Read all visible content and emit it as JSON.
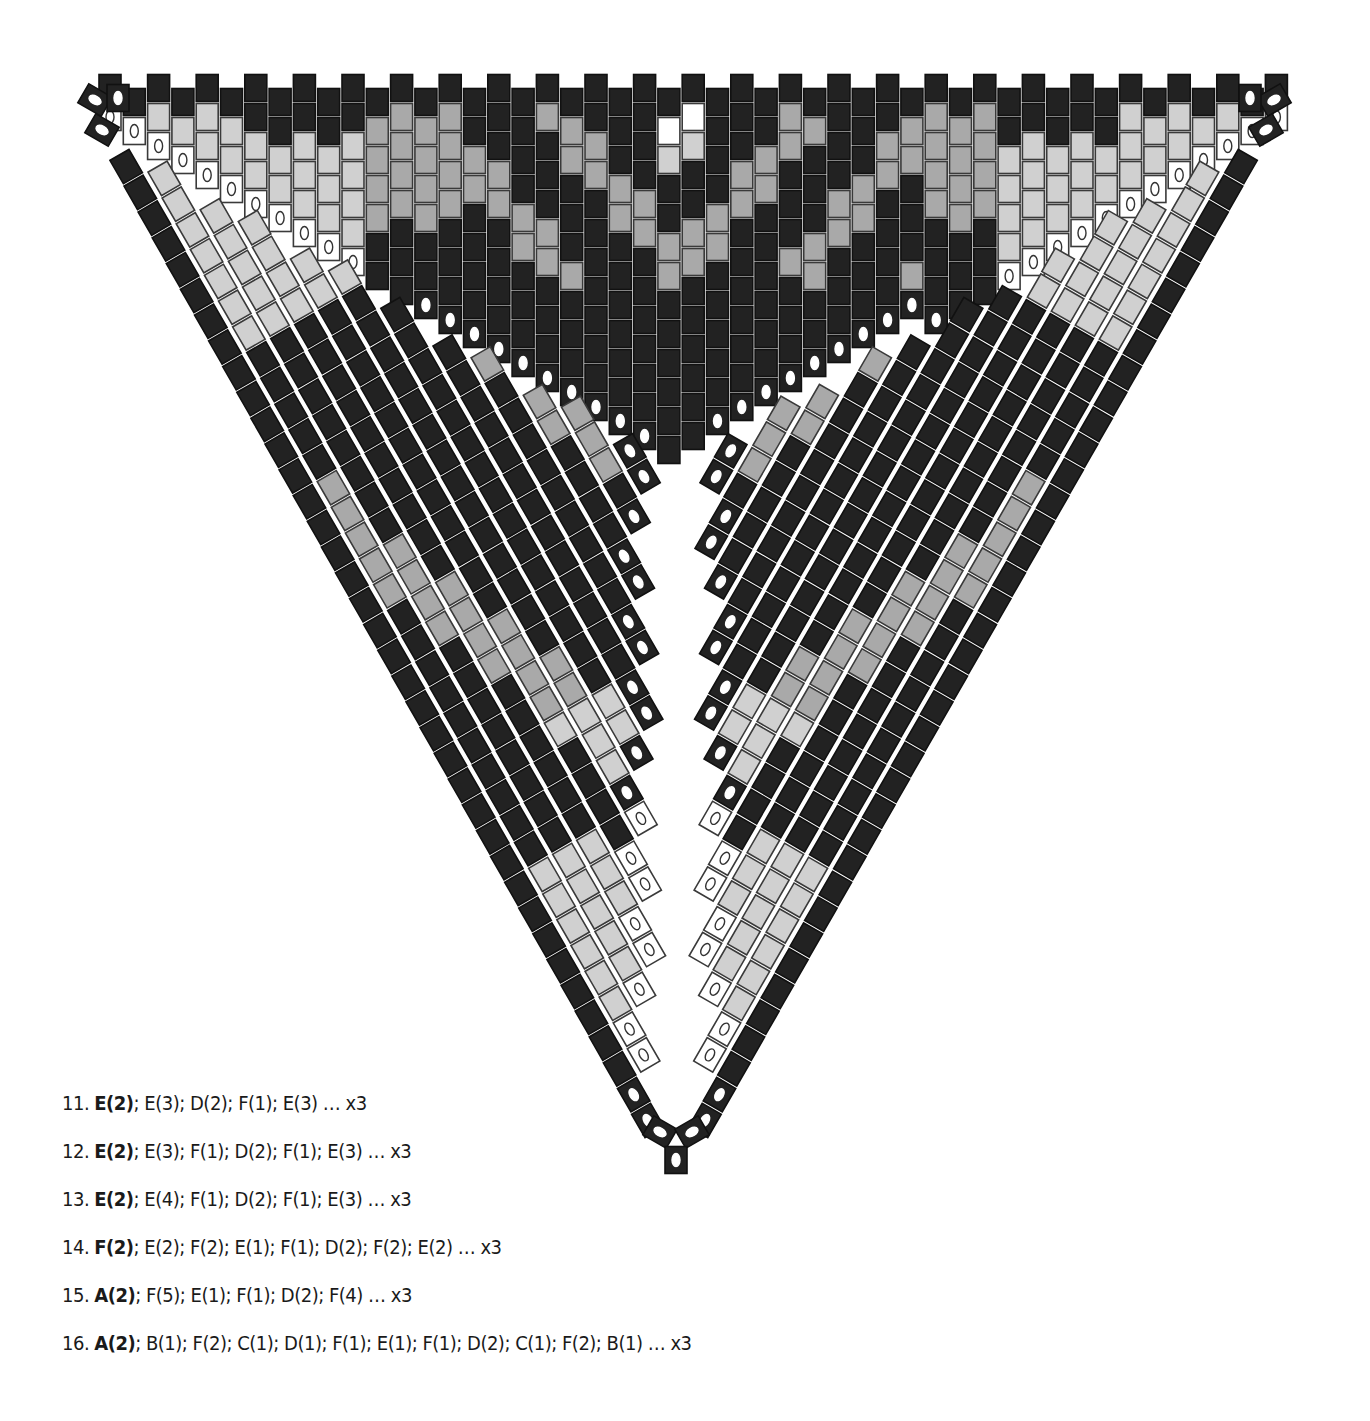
{
  "diagram": {
    "type": "peyote-triangle-bead-chart",
    "top_left": [
      78,
      75
    ],
    "top_right": [
      1290,
      75
    ],
    "apex": [
      676,
      1172
    ],
    "bead_size": [
      22,
      27
    ],
    "column_pitch": 24.3,
    "row_pitch": 29,
    "colors": {
      "A": "#1c1c1c",
      "dark": "#222222",
      "mid": "#a9a9a9",
      "light": "#d0d0d0",
      "white": "#ffffff",
      "outline": "#3a3a3a",
      "gap": "#ffffff"
    },
    "legend_note": "Beads marked with an oval are corner/increase beads"
  },
  "instructions": [
    {
      "num": "11.",
      "bold": "E(2)",
      "rest": "; E(3); D(2); F(1); E(3) … x3"
    },
    {
      "num": "12.",
      "bold": "E(2)",
      "rest": "; E(3); F(1); D(2); F(1); E(3) … x3"
    },
    {
      "num": "13.",
      "bold": "E(2)",
      "rest": "; E(4); F(1); D(2); F(1); E(3) … x3"
    },
    {
      "num": "14.",
      "bold": "F(2)",
      "rest": "; E(2); F(2); E(1); F(1); D(2); F(2); E(2) … x3"
    },
    {
      "num": "15.",
      "bold": "A(2)",
      "rest": "; F(5); E(1); F(1); D(2); F(4) … x3"
    },
    {
      "num": "16.",
      "bold": "A(2)",
      "rest": "; B(1); F(2); C(1); D(1); F(1); E(1); F(1); D(2); C(1); F(2); B(1) … x3"
    }
  ]
}
